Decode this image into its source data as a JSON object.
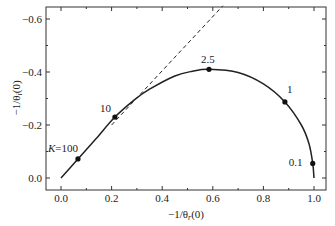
{
  "chart_data": {
    "type": "line",
    "title": "",
    "xlabel": "−1/θ_r(0)",
    "ylabel": "−1/θ_i(0)",
    "xlim": [
      -0.05,
      1.03
    ],
    "ylim": [
      0.05,
      -0.65
    ],
    "y_axis_inverted": true,
    "grid": false,
    "legend": null,
    "x_ticks": [
      0.0,
      0.2,
      0.4,
      0.6,
      0.8,
      1.0
    ],
    "x_tick_labels": [
      "0.0",
      "0.2",
      "0.4",
      "0.6",
      "0.8",
      "1.0"
    ],
    "y_ticks": [
      0.0,
      -0.2,
      -0.4,
      -0.6
    ],
    "y_tick_labels": [
      "0.0",
      "−0.2",
      "−0.4",
      "−0.6"
    ],
    "series": [
      {
        "name": "solid-curve",
        "style": "solid",
        "x": [
          0.0,
          0.067,
          0.14,
          0.213,
          0.29,
          0.35,
          0.45,
          0.52,
          0.585,
          0.7,
          0.8,
          0.885,
          0.95,
          0.98,
          0.995,
          1.0
        ],
        "y": [
          0.0,
          -0.072,
          -0.15,
          -0.23,
          -0.295,
          -0.335,
          -0.385,
          -0.403,
          -0.41,
          -0.398,
          -0.355,
          -0.287,
          -0.2,
          -0.13,
          -0.055,
          0.0
        ]
      },
      {
        "name": "dashed-asymptote",
        "style": "dashed",
        "x": [
          0.2,
          0.64
        ],
        "y": [
          -0.2,
          -0.65
        ]
      }
    ],
    "markers": [
      {
        "label": "K=100",
        "x": 0.067,
        "y": -0.072
      },
      {
        "label": "10",
        "x": 0.213,
        "y": -0.23
      },
      {
        "label": "2.5",
        "x": 0.585,
        "y": -0.41
      },
      {
        "label": "1",
        "x": 0.885,
        "y": -0.287
      },
      {
        "label": "0.1",
        "x": 0.995,
        "y": -0.055
      }
    ]
  },
  "labels": {
    "xlabel_main": "−1/θ",
    "xlabel_sub": "r",
    "xlabel_tail": "(0)",
    "ylabel_main": "−1/θ",
    "ylabel_sub": "i",
    "ylabel_tail": "(0)"
  }
}
